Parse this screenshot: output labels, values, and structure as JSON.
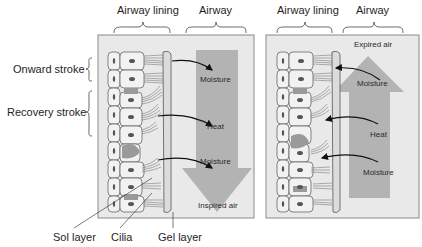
{
  "figure": {
    "left_panel": {
      "header_lining": "Airway lining",
      "header_airway": "Airway",
      "airflow_label": "Inspired air",
      "airflow_direction": "down",
      "transfer_labels": [
        "Moisture",
        "Heat",
        "Moisture"
      ],
      "transfer_direction": "lining-to-airway"
    },
    "right_panel": {
      "header_lining": "Airway lining",
      "header_airway": "Airway",
      "airflow_label": "Expired air",
      "airflow_direction": "up",
      "transfer_labels": [
        "Moisture",
        "Heat",
        "Moisture"
      ],
      "transfer_direction": "airway-to-lining"
    },
    "side_labels": {
      "onward": "Onward stroke",
      "recovery": "Recovery stroke"
    },
    "bottom_labels": {
      "sol": "Sol layer",
      "cilia": "Cilia",
      "gel": "Gel layer"
    },
    "colors": {
      "panel_bg": "#e9e9e9",
      "panel_border": "#8a8a8a",
      "airflow_arrow": "#a9a9a9",
      "cell_fill": "#f2f2f2",
      "nucleus": "#555555",
      "gel_layer": "#dcdcdc"
    }
  }
}
